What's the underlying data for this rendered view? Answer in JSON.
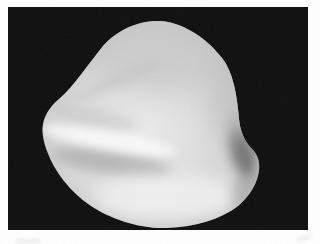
{
  "figure": {
    "object": "smooth blob-like 3D solid",
    "style": "grayscale shaded render, scanned print figure",
    "colors": {
      "page": "#ffffff",
      "panel": "#0f0f0f",
      "base_core": "#ececec",
      "base_mid": "#d8d8d8",
      "base_edge": "#c2c2c2",
      "highlight_band": "#f7f7f7",
      "bottom_highlight": "#f0f0f0",
      "soft_shadow": "#a6a6a6",
      "deep_shadow": "#6a6a6a",
      "edge_tint": "#bdbdbd",
      "artifact": "#dcdcdc"
    }
  }
}
